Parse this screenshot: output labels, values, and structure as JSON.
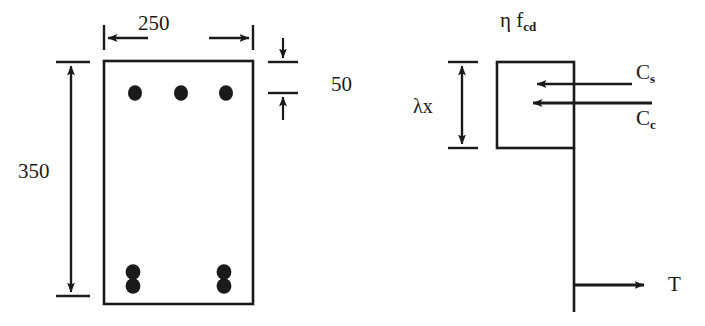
{
  "diagram": {
    "ink_color": "#1a1a1a",
    "background_color": "#ffffff"
  },
  "cross_section": {
    "width_dimension": "250",
    "height_dimension": "350",
    "cover_dimension": "50",
    "top_bars_count": 3,
    "bottom_bar_pairs_count": 2,
    "bars_per_bottom_pair": 2
  },
  "stress_block": {
    "stress_label_prefix": "η f",
    "stress_label_subscript": "cd",
    "depth_label": "λx",
    "forces": [
      {
        "symbol": "C",
        "subscript": "s",
        "name": "steel-compression-force"
      },
      {
        "symbol": "C",
        "subscript": "c",
        "name": "concrete-compression-force"
      },
      {
        "symbol": "T",
        "subscript": "",
        "name": "tension-force"
      }
    ]
  }
}
